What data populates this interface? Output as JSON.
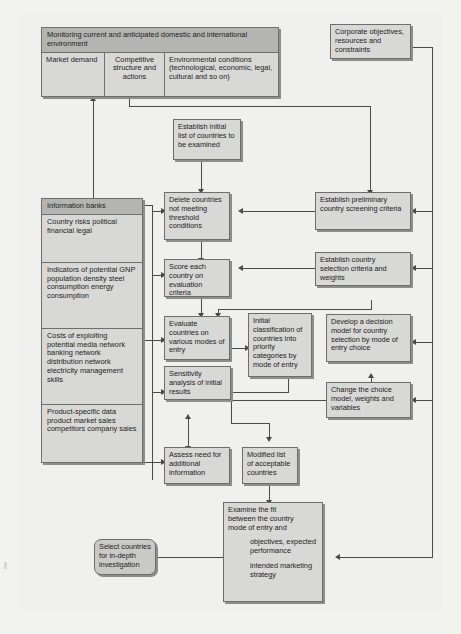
{
  "diagram": {
    "background_color": "#f2f2f0",
    "node_fill": "#d8d8d6",
    "header_fill": "#b4b4b2",
    "terminal_fill": "#c9c9c7",
    "border_color": "#6d6d6b",
    "connector_color": "#4a4a48"
  },
  "monitoring": {
    "header": "Monitoring current and anticipated domestic and international environment",
    "columns": [
      "Market demand",
      "Competitive structure and actions",
      "Environmental conditions (technological, economic, legal, cultural and so on)"
    ]
  },
  "corporate": {
    "label": "Corporate objectives, resources and constraints"
  },
  "info_banks": {
    "header": "Information banks",
    "sections": [
      {
        "title": "Country risks",
        "items": [
          "political",
          "financial",
          "legal"
        ]
      },
      {
        "title": "Indicators of potential",
        "items": [
          "GNP",
          "population",
          "density",
          "steel consumption",
          "energy consumption"
        ]
      },
      {
        "title": "Costs of exploiting potential",
        "items": [
          "media network",
          "banking network",
          "distribution network",
          "electricity",
          "management skills"
        ]
      },
      {
        "title": "Product-specific data",
        "items": [
          "product market sales",
          "competitors",
          "company sales"
        ]
      }
    ]
  },
  "center_nodes": {
    "establish_initial_list": "Establish initial list of countries to be examined",
    "delete_countries": "Delete countries not meeting threshold conditions",
    "score_each_country": "Score each country on evaluation criteria",
    "evaluate_countries": "Evaluate countries on various modes of entry",
    "sensitivity_analysis": "Sensitivity analysis of initial results",
    "assess_need": "Assess need for additional information"
  },
  "middle_nodes": {
    "initial_classification": "Initial classification of countries into priority categories by mode of entry",
    "modified_list": "Modified list of acceptable countries"
  },
  "right_nodes": {
    "preliminary_criteria": "Establish preliminary country screening criteria",
    "selection_criteria": "Establish country selection criteria and weights",
    "decision_model": "Develop a decision model for country selection by mode of entry choice",
    "change_choice_model": "Change the choice model, weights and variables"
  },
  "examine_fit": {
    "line1": "Examine the fit",
    "line2": "between the country",
    "line3": "mode of entry and",
    "item1_line1": "objectives, expected",
    "item1_line2": "performance",
    "item2_line1": "intended marketing",
    "item2_line2": "strategy"
  },
  "terminal": {
    "label": "Select countries for in-depth investigation"
  }
}
